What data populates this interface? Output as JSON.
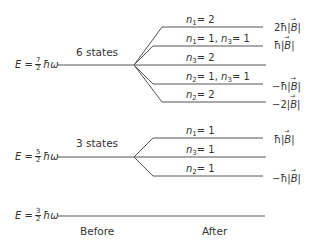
{
  "levels": [
    {
      "id": "E72",
      "energy": {
        "prefix": "E =",
        "num": "7",
        "den": "2",
        "suffix": "ħω"
      },
      "states_label": "6 states",
      "y": 65,
      "splits": [
        {
          "label_parts": [
            {
              "var": "n",
              "sub": "1",
              "val": "= 2"
            }
          ],
          "shift": "2ħ|B|",
          "shift_coeff": "2ħ",
          "y": 27
        },
        {
          "label_parts": [
            {
              "var": "n",
              "sub": "1",
              "val": "= 1, "
            },
            {
              "var": "n",
              "sub": "3",
              "val": "= 1"
            }
          ],
          "shift": "ħ|B|",
          "shift_coeff": "ħ",
          "y": 46
        },
        {
          "label_parts": [
            {
              "var": "n",
              "sub": "3",
              "val": "= 2"
            }
          ],
          "shift": "",
          "shift_coeff": "",
          "y": 65
        },
        {
          "label_parts": [
            {
              "var": "n",
              "sub": "2",
              "val": "= 1, "
            },
            {
              "var": "n",
              "sub": "3",
              "val": "= 1"
            }
          ],
          "shift": "−ħ|B|",
          "shift_coeff": "−ħ",
          "y": 84
        },
        {
          "label_parts": [
            {
              "var": "n",
              "sub": "2",
              "val": "= 2"
            }
          ],
          "shift": "−2|B|",
          "shift_coeff": "−2",
          "y": 102
        }
      ]
    },
    {
      "id": "E52",
      "energy": {
        "prefix": "E =",
        "num": "5",
        "den": "2",
        "suffix": "ħω"
      },
      "states_label": "3 states",
      "y": 157,
      "splits": [
        {
          "label_parts": [
            {
              "var": "n",
              "sub": "1",
              "val": "= 1"
            }
          ],
          "shift": "ħ|B|",
          "shift_coeff": "ħ",
          "y": 138
        },
        {
          "label_parts": [
            {
              "var": "n",
              "sub": "3",
              "val": "= 1"
            }
          ],
          "shift": "",
          "shift_coeff": "",
          "y": 157
        },
        {
          "label_parts": [
            {
              "var": "n",
              "sub": "2",
              "val": "= 1"
            }
          ],
          "shift": "−ħ|B|",
          "shift_coeff": "−ħ",
          "y": 176
        }
      ]
    },
    {
      "id": "E32",
      "energy": {
        "prefix": "E =",
        "num": "3",
        "den": "2",
        "suffix": "ħω"
      },
      "states_label": "",
      "y": 216,
      "splits": []
    }
  ],
  "axis_labels": {
    "before": "Before",
    "after": "After"
  },
  "b_symbol": "B",
  "colors": {
    "line": "#555555",
    "text": "#333333"
  }
}
